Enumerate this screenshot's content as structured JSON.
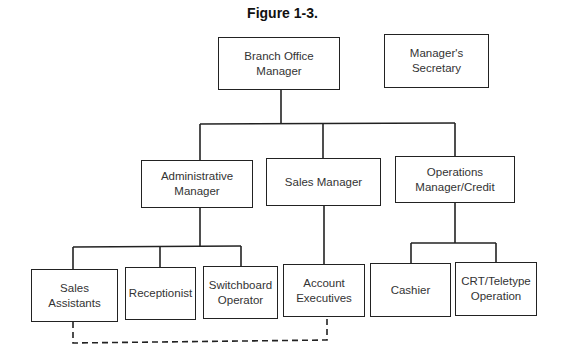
{
  "title": "Figure 1-3.",
  "nodes": {
    "branch": "Branch Office Manager",
    "secretary": "Manager's Secretary",
    "admin": "Administrative Manager",
    "sales": "Sales Manager",
    "ops": "Operations Manager/Credit",
    "sales_assistants": "Sales Assistants",
    "receptionist": "Receptionist",
    "switchboard": "Switchboard Operator",
    "account_execs": "Account Executives",
    "cashier": "Cashier",
    "crt": "CRT/Teletype Operation"
  },
  "edges": [
    {
      "from": "branch",
      "to": "admin",
      "style": "solid"
    },
    {
      "from": "branch",
      "to": "sales",
      "style": "solid"
    },
    {
      "from": "branch",
      "to": "ops",
      "style": "solid"
    },
    {
      "from": "admin",
      "to": "sales_assistants",
      "style": "solid"
    },
    {
      "from": "admin",
      "to": "receptionist",
      "style": "solid"
    },
    {
      "from": "admin",
      "to": "switchboard",
      "style": "solid"
    },
    {
      "from": "sales",
      "to": "account_execs",
      "style": "solid"
    },
    {
      "from": "ops",
      "to": "cashier",
      "style": "solid"
    },
    {
      "from": "ops",
      "to": "crt",
      "style": "solid"
    },
    {
      "from": "sales_assistants",
      "to": "account_execs",
      "style": "dashed"
    }
  ]
}
